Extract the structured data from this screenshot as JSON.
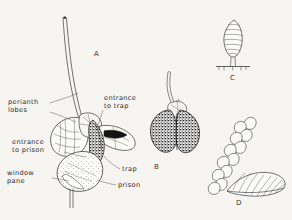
{
  "figure": {
    "background_color": "#f6f5f2",
    "ink_color": "#2b2b2b",
    "panels": [
      {
        "letter": "A",
        "caption": "A",
        "description": "whole flower with perianth lobes, trap and prison chambers in longitudinal section"
      },
      {
        "letter": "B",
        "caption": "B",
        "description": "dark bilobed trap entrance viewed externally with curved stalk"
      },
      {
        "letter": "C",
        "caption": "C",
        "description": "stalked ovoid gland with transverse striations on a basal foot plate"
      },
      {
        "letter": "D",
        "caption": "D",
        "description": "chain of cells with fan-shaped ribbed scale"
      }
    ],
    "labels": [
      {
        "id": "perianth-lobes",
        "line1": "perianth",
        "line2": "lobes"
      },
      {
        "id": "entrance-to-trap",
        "line1": "entrance",
        "line2": "to trap"
      },
      {
        "id": "entrance-to-prison",
        "line1": "entrance",
        "line2": "to prison"
      },
      {
        "id": "window-pane",
        "line1": "window",
        "line2": "pane"
      },
      {
        "id": "trap",
        "line1": "trap",
        "line2": ""
      },
      {
        "id": "prison",
        "line1": "prison",
        "line2": ""
      }
    ]
  }
}
